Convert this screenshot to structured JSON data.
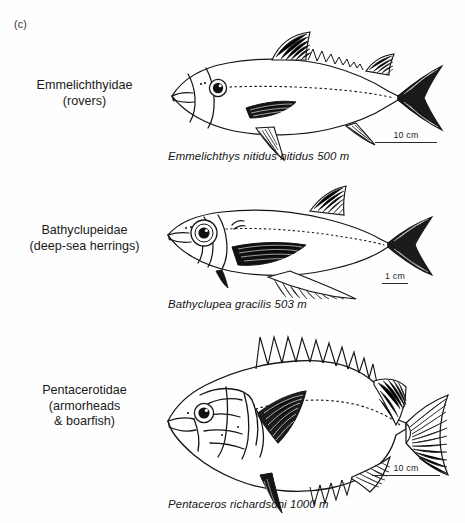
{
  "figure": {
    "panel_label": "(c)",
    "background_color": "#fefefe",
    "ink_color": "#1a1a1a"
  },
  "panels": [
    {
      "family": "Emmelichthyidae",
      "common_name": "(rovers)",
      "species": "Emmelichthys nitidus nitidus",
      "depth": "500 m",
      "caption": "Emmelichthys nitidus nitidus  500 m",
      "scale_label": "10 cm",
      "scale_bar_px": 62,
      "body_form": "fusiform-rover"
    },
    {
      "family": "Bathyclupeidae",
      "common_name": "(deep-sea herrings)",
      "species": "Bathyclupea gracilis",
      "depth": "503 m",
      "caption": "Bathyclupea gracilis 503 m",
      "scale_label": "1 cm",
      "scale_bar_px": 26,
      "body_form": "compressed-herring"
    },
    {
      "family": "Pentacerotidae",
      "common_name_lines": [
        "(armorheads",
        "& boarfish)"
      ],
      "species": "Pentaceros  richardsoni",
      "depth": "1000 m",
      "caption": "Pentaceros  richardsoni 1000 m",
      "scale_label": "10 cm",
      "scale_bar_px": 68,
      "body_form": "deep-bodied-armorhead"
    }
  ]
}
